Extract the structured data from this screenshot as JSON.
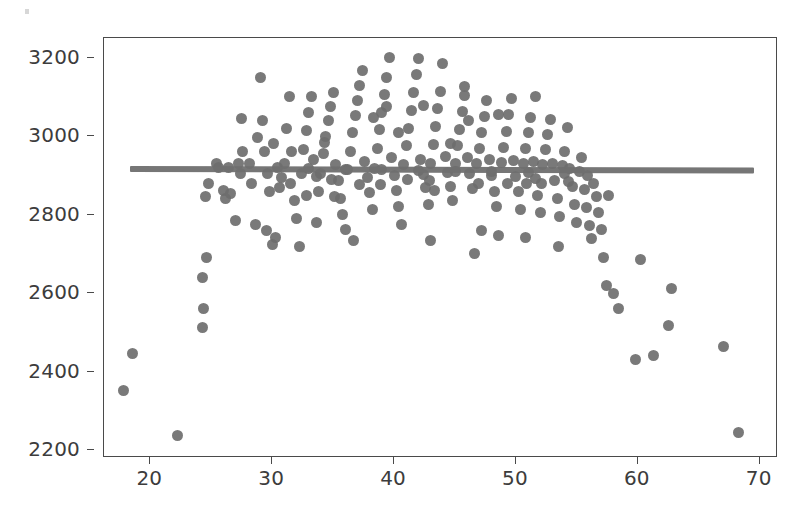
{
  "chart_data": {
    "type": "scatter",
    "title": "",
    "xlabel": "",
    "ylabel": "",
    "xlim": [
      16.2,
      71.5
    ],
    "ylim": [
      2180,
      3250
    ],
    "xticks": [
      20,
      30,
      40,
      50,
      60,
      70
    ],
    "yticks": [
      2200,
      2400,
      2600,
      2800,
      3000,
      3200
    ],
    "xtick_labels": [
      "20",
      "30",
      "40",
      "50",
      "60",
      "70"
    ],
    "ytick_labels": [
      "2200",
      "2400",
      "2600",
      "2800",
      "3000",
      "3200"
    ],
    "grid": false,
    "legend": null,
    "marker_color": "#6e6e6e",
    "marker_size": 11,
    "frame_color": "#4a4a4a",
    "background": "#ffffff",
    "series": [
      {
        "name": "observations",
        "marker": "circle",
        "points": [
          [
            17.8,
            2352
          ],
          [
            18.5,
            2445
          ],
          [
            22.2,
            2237
          ],
          [
            24.3,
            2512
          ],
          [
            24.4,
            2560
          ],
          [
            24.3,
            2640
          ],
          [
            24.6,
            2690
          ],
          [
            24.5,
            2845
          ],
          [
            24.8,
            2880
          ],
          [
            25.6,
            2920
          ],
          [
            25.4,
            2930
          ],
          [
            26.0,
            2862
          ],
          [
            26.2,
            2840
          ],
          [
            26.6,
            2855
          ],
          [
            27.0,
            2786
          ],
          [
            27.4,
            2905
          ],
          [
            27.6,
            2960
          ],
          [
            27.5,
            3045
          ],
          [
            28.1,
            2930
          ],
          [
            28.3,
            2880
          ],
          [
            28.6,
            2776
          ],
          [
            29.0,
            3150
          ],
          [
            29.2,
            3040
          ],
          [
            29.4,
            2960
          ],
          [
            29.6,
            2905
          ],
          [
            29.5,
            2760
          ],
          [
            30.0,
            2725
          ],
          [
            30.3,
            2742
          ],
          [
            30.6,
            2868
          ],
          [
            30.8,
            2895
          ],
          [
            31.0,
            2930
          ],
          [
            31.2,
            3020
          ],
          [
            31.4,
            3100
          ],
          [
            31.6,
            2960
          ],
          [
            31.8,
            2835
          ],
          [
            32.0,
            2790
          ],
          [
            32.2,
            2718
          ],
          [
            32.4,
            2905
          ],
          [
            32.6,
            2965
          ],
          [
            32.8,
            3015
          ],
          [
            33.0,
            3060
          ],
          [
            33.2,
            3100
          ],
          [
            33.4,
            2940
          ],
          [
            33.6,
            2896
          ],
          [
            33.8,
            2860
          ],
          [
            34.0,
            2905
          ],
          [
            34.2,
            2955
          ],
          [
            34.4,
            3000
          ],
          [
            34.6,
            3040
          ],
          [
            34.8,
            3075
          ],
          [
            35.0,
            3110
          ],
          [
            35.2,
            2928
          ],
          [
            35.4,
            2886
          ],
          [
            35.6,
            2842
          ],
          [
            35.8,
            2800
          ],
          [
            36.0,
            2762
          ],
          [
            36.2,
            2914
          ],
          [
            36.4,
            2962
          ],
          [
            36.6,
            3008
          ],
          [
            36.8,
            3052
          ],
          [
            37.0,
            3090
          ],
          [
            37.2,
            3130
          ],
          [
            37.4,
            3168
          ],
          [
            37.6,
            2935
          ],
          [
            37.8,
            2895
          ],
          [
            38.0,
            2856
          ],
          [
            38.2,
            2812
          ],
          [
            38.4,
            2918
          ],
          [
            38.6,
            2968
          ],
          [
            38.8,
            3016
          ],
          [
            39.0,
            3060
          ],
          [
            39.2,
            3105
          ],
          [
            39.4,
            3150
          ],
          [
            39.6,
            3200
          ],
          [
            39.8,
            2945
          ],
          [
            40.0,
            2900
          ],
          [
            40.2,
            2862
          ],
          [
            40.4,
            2820
          ],
          [
            40.6,
            2775
          ],
          [
            40.8,
            2928
          ],
          [
            41.0,
            2975
          ],
          [
            41.2,
            3020
          ],
          [
            41.4,
            3066
          ],
          [
            41.6,
            3112
          ],
          [
            41.8,
            3158
          ],
          [
            42.0,
            3198
          ],
          [
            42.2,
            2940
          ],
          [
            42.4,
            2902
          ],
          [
            42.6,
            2868
          ],
          [
            42.8,
            2826
          ],
          [
            43.0,
            2930
          ],
          [
            43.2,
            2978
          ],
          [
            43.4,
            3024
          ],
          [
            43.6,
            3070
          ],
          [
            43.8,
            3114
          ],
          [
            44.0,
            3186
          ],
          [
            44.2,
            2948
          ],
          [
            44.4,
            2908
          ],
          [
            44.6,
            2872
          ],
          [
            44.8,
            2836
          ],
          [
            45.0,
            2930
          ],
          [
            45.2,
            2975
          ],
          [
            45.4,
            3018
          ],
          [
            45.6,
            3062
          ],
          [
            45.8,
            3104
          ],
          [
            46.0,
            2945
          ],
          [
            46.2,
            2905
          ],
          [
            46.4,
            2866
          ],
          [
            46.6,
            2700
          ],
          [
            46.8,
            2930
          ],
          [
            47.0,
            2968
          ],
          [
            47.2,
            3010
          ],
          [
            47.4,
            3050
          ],
          [
            47.6,
            3090
          ],
          [
            47.8,
            2940
          ],
          [
            48.0,
            2900
          ],
          [
            48.2,
            2860
          ],
          [
            48.4,
            2820
          ],
          [
            48.6,
            2748
          ],
          [
            48.8,
            2932
          ],
          [
            49.0,
            2972
          ],
          [
            49.2,
            3012
          ],
          [
            49.4,
            3056
          ],
          [
            49.6,
            3096
          ],
          [
            49.8,
            2938
          ],
          [
            50.0,
            2898
          ],
          [
            50.2,
            2858
          ],
          [
            50.4,
            2812
          ],
          [
            50.6,
            2930
          ],
          [
            50.8,
            2968
          ],
          [
            51.0,
            3008
          ],
          [
            51.2,
            3048
          ],
          [
            51.4,
            2935
          ],
          [
            51.6,
            2892
          ],
          [
            51.8,
            2850
          ],
          [
            52.0,
            2805
          ],
          [
            52.2,
            2928
          ],
          [
            52.4,
            2965
          ],
          [
            52.6,
            3005
          ],
          [
            52.8,
            3042
          ],
          [
            53.0,
            2930
          ],
          [
            53.2,
            2886
          ],
          [
            53.4,
            2840
          ],
          [
            53.6,
            2796
          ],
          [
            53.8,
            2924
          ],
          [
            54.0,
            2962
          ],
          [
            54.2,
            3022
          ],
          [
            54.4,
            2918
          ],
          [
            54.6,
            2872
          ],
          [
            54.8,
            2826
          ],
          [
            55.0,
            2780
          ],
          [
            55.2,
            2910
          ],
          [
            55.4,
            2946
          ],
          [
            55.6,
            2865
          ],
          [
            55.8,
            2818
          ],
          [
            56.0,
            2772
          ],
          [
            56.2,
            2738
          ],
          [
            56.4,
            2880
          ],
          [
            56.6,
            2845
          ],
          [
            56.8,
            2805
          ],
          [
            57.0,
            2762
          ],
          [
            57.2,
            2690
          ],
          [
            57.4,
            2620
          ],
          [
            57.6,
            2848
          ],
          [
            58.0,
            2600
          ],
          [
            58.4,
            2560
          ],
          [
            59.8,
            2430
          ],
          [
            60.2,
            2685
          ],
          [
            61.3,
            2440
          ],
          [
            62.5,
            2518
          ],
          [
            62.8,
            2612
          ],
          [
            67.0,
            2465
          ],
          [
            68.3,
            2245
          ],
          [
            26.4,
            2920
          ],
          [
            27.2,
            2930
          ],
          [
            30.4,
            2920
          ],
          [
            33.0,
            2918
          ],
          [
            36.0,
            2916
          ],
          [
            39.0,
            2914
          ],
          [
            42.0,
            2912
          ],
          [
            45.0,
            2910
          ],
          [
            48.0,
            2910
          ],
          [
            51.0,
            2908
          ],
          [
            54.0,
            2906
          ],
          [
            34.3,
            2985
          ],
          [
            35.1,
            2845
          ],
          [
            38.3,
            3048
          ],
          [
            41.1,
            2890
          ],
          [
            43.3,
            2862
          ],
          [
            46.1,
            3040
          ],
          [
            49.3,
            2880
          ],
          [
            52.1,
            2880
          ],
          [
            44.6,
            2980
          ],
          [
            37.2,
            2876
          ],
          [
            40.4,
            3010
          ],
          [
            30.1,
            2980
          ],
          [
            28.8,
            2996
          ],
          [
            33.6,
            2780
          ],
          [
            36.7,
            2735
          ],
          [
            43.0,
            2735
          ],
          [
            47.2,
            2760
          ],
          [
            50.8,
            2742
          ],
          [
            53.5,
            2720
          ],
          [
            31.5,
            2880
          ],
          [
            34.9,
            2890
          ],
          [
            38.9,
            2878
          ],
          [
            42.9,
            2886
          ],
          [
            46.9,
            2880
          ],
          [
            50.9,
            2880
          ],
          [
            54.3,
            2884
          ],
          [
            55.9,
            2900
          ],
          [
            29.8,
            2860
          ],
          [
            32.8,
            2848
          ],
          [
            45.8,
            3126
          ],
          [
            48.6,
            3056
          ],
          [
            51.6,
            3100
          ],
          [
            42.4,
            3078
          ],
          [
            39.4,
            3076
          ]
        ]
      },
      {
        "name": "fit-line",
        "type": "line",
        "x": [
          18.3,
          69.5
        ],
        "y": [
          2916,
          2912
        ]
      }
    ]
  }
}
